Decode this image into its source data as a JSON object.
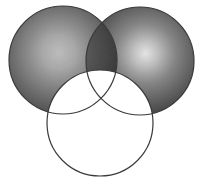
{
  "figure": {
    "canvas": {
      "width": 204,
      "height": 188,
      "background": "#ffffff"
    },
    "stroke": {
      "color": "#3a3a3a",
      "width": 1.2
    },
    "palette": {
      "sphere_highlight_left": "#d6d6d6",
      "sphere_midtone_left": "#a8a8a8",
      "sphere_edge_left": "#6e6e6e",
      "sphere_highlight_right": "#f0f0f0",
      "sphere_midtone_right": "#a0a0a0",
      "sphere_edge_right": "#6a6a6a",
      "overlap_fill": "#7d7d7d",
      "empty_fill": "#ffffff",
      "outline": "#3a3a3a"
    },
    "circles": [
      {
        "id": "left",
        "label": "Left shaded circle",
        "cx": 63,
        "cy": 60,
        "r": 54,
        "fill_style": "radial-gradient",
        "highlight_x": 58,
        "highlight_y": 56,
        "filled": true
      },
      {
        "id": "right",
        "label": "Right shaded circle",
        "cx": 140,
        "cy": 61,
        "r": 54,
        "fill_style": "radial-gradient",
        "highlight_x": 146,
        "highlight_y": 58,
        "filled": true
      },
      {
        "id": "bottom",
        "label": "Bottom outline circle",
        "cx": 100,
        "cy": 123,
        "r": 53,
        "fill_style": "none",
        "highlight_x": 0,
        "highlight_y": 0,
        "filled": false
      }
    ],
    "overlaps": [
      {
        "id": "left-right-lens",
        "label": "Left and right circle intersection",
        "shade": "darker"
      }
    ]
  }
}
